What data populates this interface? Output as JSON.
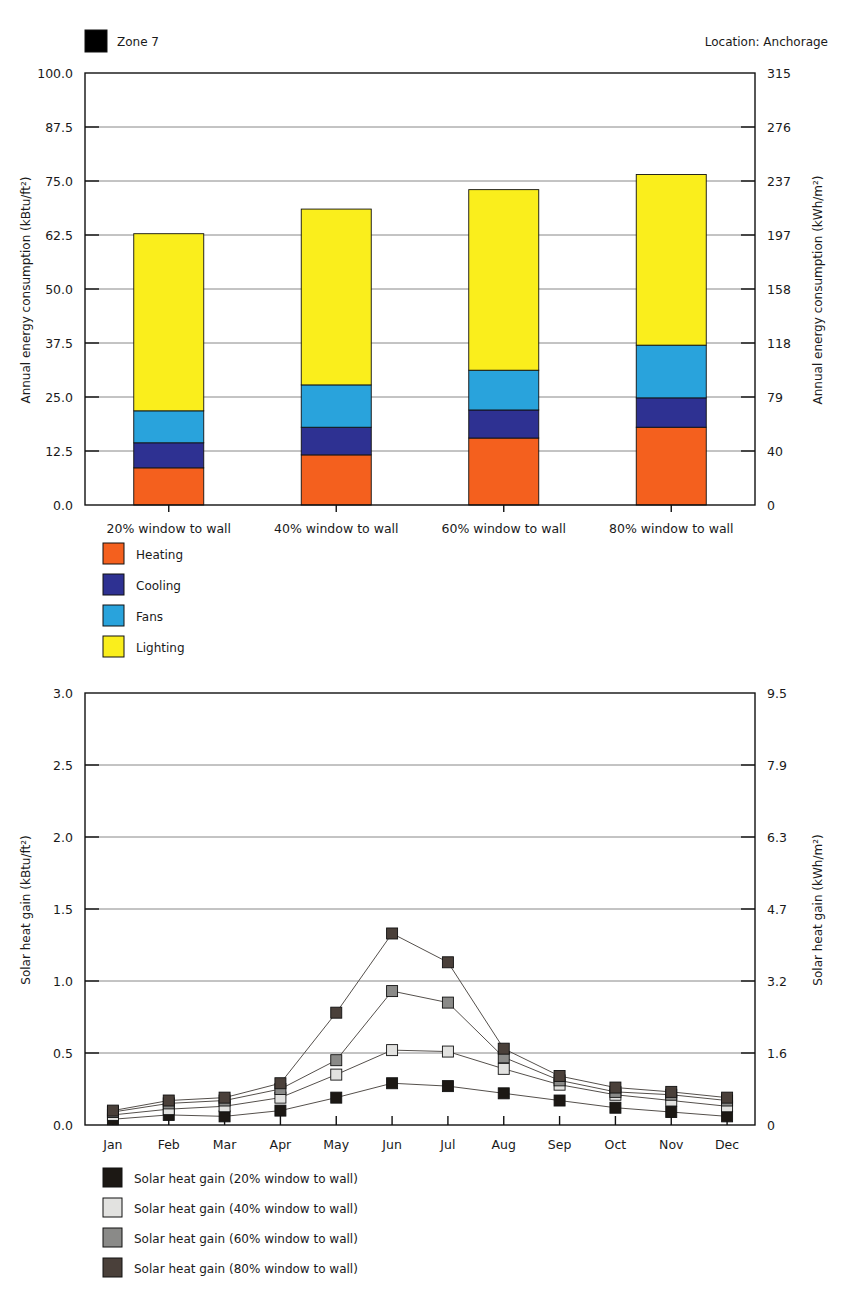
{
  "top": {
    "zone_label": "Zone 7",
    "zone_swatch_color": "#F5954A",
    "location_label": "Location:  Anchorage",
    "left_axis_title": "Annual energy consumption (kBtu/ft²)",
    "right_axis_title": "Annual energy consumption (kWh/m²)",
    "left_ticks": [
      "100.0",
      "87.5",
      "75.0",
      "62.5",
      "50.0",
      "37.5",
      "25.0",
      "12.5",
      "0.0"
    ],
    "right_ticks": [
      "315",
      "276",
      "237",
      "197",
      "158",
      "118",
      "79",
      "40",
      "0"
    ],
    "legend": [
      {
        "label": "Heating",
        "color": "#F4601E"
      },
      {
        "label": "Cooling",
        "color": "#2E3192"
      },
      {
        "label": "Fans",
        "color": "#29A3DC"
      },
      {
        "label": "Lighting",
        "color": "#FAEE1C"
      }
    ]
  },
  "bottom": {
    "left_axis_title": "Solar heat gain (kBtu/ft²)",
    "right_axis_title": "Solar heat gain (kWh/m²)",
    "left_ticks": [
      "3.0",
      "2.5",
      "2.0",
      "1.5",
      "1.0",
      "0.5",
      "0.0"
    ],
    "right_ticks": [
      "9.5",
      "7.9",
      "6.3",
      "4.7",
      "3.2",
      "1.6",
      "0"
    ],
    "legend": [
      {
        "label": "Solar heat gain (20% window to wall)",
        "color": "#1c1814"
      },
      {
        "label": "Solar heat gain (40% window to wall)",
        "color": "#e2e2e0"
      },
      {
        "label": "Solar heat gain (60% window to wall)",
        "color": "#8a8a88"
      },
      {
        "label": "Solar heat gain (80% window to wall)",
        "color": "#4a403a"
      }
    ]
  },
  "chart_data": [
    {
      "type": "bar",
      "stacked": true,
      "title": "Annual energy consumption by window-to-wall ratio",
      "xlabel": "",
      "ylabel": "Annual energy consumption (kBtu/ft²)",
      "ylabel_right": "Annual energy consumption (kWh/m²)",
      "ylim": [
        0,
        100
      ],
      "ylim_right": [
        0,
        315
      ],
      "yticks": [
        0,
        12.5,
        25,
        37.5,
        50,
        62.5,
        75,
        87.5,
        100
      ],
      "yticks_right": [
        0,
        40,
        79,
        118,
        158,
        197,
        237,
        276,
        315
      ],
      "grid": true,
      "legend_position": "below-left",
      "categories": [
        "20% window to wall",
        "40% window to wall",
        "60% window to wall",
        "80% window to wall"
      ],
      "series": [
        {
          "name": "Heating",
          "color": "#F4601E",
          "values": [
            8.6,
            11.6,
            15.5,
            18.0
          ]
        },
        {
          "name": "Cooling",
          "color": "#2E3192",
          "values": [
            5.8,
            6.4,
            6.5,
            6.8
          ]
        },
        {
          "name": "Fans",
          "color": "#29A3DC",
          "values": [
            7.4,
            9.8,
            9.2,
            12.2
          ]
        },
        {
          "name": "Lighting",
          "color": "#FAEE1C",
          "values": [
            41.0,
            40.7,
            41.8,
            39.5
          ]
        }
      ],
      "totals": [
        62.8,
        68.5,
        73.0,
        76.5
      ]
    },
    {
      "type": "line",
      "title": "Monthly solar heat gain by window-to-wall ratio",
      "xlabel": "",
      "ylabel": "Solar heat gain (kBtu/ft²)",
      "ylabel_right": "Solar heat gain (kWh/m²)",
      "ylim": [
        0,
        3.0
      ],
      "ylim_right": [
        0,
        9.5
      ],
      "yticks": [
        0,
        0.5,
        1.0,
        1.5,
        2.0,
        2.5,
        3.0
      ],
      "yticks_right": [
        0,
        1.6,
        3.2,
        4.7,
        6.3,
        7.9,
        9.5
      ],
      "grid": true,
      "legend_position": "below-left",
      "x": [
        "Jan",
        "Feb",
        "Mar",
        "Apr",
        "May",
        "Jun",
        "Jul",
        "Aug",
        "Sep",
        "Oct",
        "Nov",
        "Dec"
      ],
      "series": [
        {
          "name": "Solar heat gain (20% window to wall)",
          "color": "#1c1814",
          "values": [
            0.04,
            0.07,
            0.06,
            0.1,
            0.19,
            0.29,
            0.27,
            0.22,
            0.17,
            0.12,
            0.09,
            0.06
          ]
        },
        {
          "name": "Solar heat gain (40% window to wall)",
          "color": "#e2e2e0",
          "values": [
            0.07,
            0.11,
            0.13,
            0.19,
            0.35,
            0.52,
            0.51,
            0.39,
            0.28,
            0.21,
            0.17,
            0.13
          ]
        },
        {
          "name": "Solar heat gain (60% window to wall)",
          "color": "#8a8a88",
          "values": [
            0.09,
            0.15,
            0.17,
            0.25,
            0.45,
            0.93,
            0.85,
            0.47,
            0.31,
            0.23,
            0.21,
            0.17
          ]
        },
        {
          "name": "Solar heat gain (80% window to wall)",
          "color": "#4a403a",
          "values": [
            0.1,
            0.17,
            0.19,
            0.29,
            0.78,
            1.33,
            1.13,
            0.53,
            0.34,
            0.26,
            0.23,
            0.19
          ]
        }
      ]
    }
  ]
}
